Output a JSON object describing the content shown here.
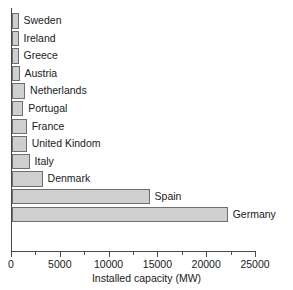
{
  "chart_data": {
    "type": "bar",
    "orientation": "horizontal",
    "title": "",
    "xlabel": "Installed capacity (MW)",
    "ylabel": "",
    "xlim": [
      0,
      25000
    ],
    "xticks": [
      0,
      5000,
      10000,
      15000,
      20000,
      25000
    ],
    "xtick_labels": [
      "0",
      "5000",
      "10000",
      "15000",
      "20000",
      "25000"
    ],
    "minor_ticks": [
      2500,
      7500,
      12500,
      17500,
      22500
    ],
    "grid": false,
    "legend": false,
    "bar_fill_color": "#cfcfcf",
    "bar_border_color": "#6e6e6e",
    "axis_color": "#4a4a4a",
    "categories": [
      "Sweden",
      "Ireland",
      "Greece",
      "Austria",
      "Netherlands",
      "Portugal",
      "France",
      "United Kindom",
      "Italy",
      "Denmark",
      "Spain",
      "Germany"
    ],
    "values": [
      670,
      670,
      670,
      770,
      1340,
      1150,
      1500,
      1500,
      1800,
      3130,
      14100,
      22100
    ],
    "bars": [
      {
        "label": "Sweden",
        "value": 670
      },
      {
        "label": "Ireland",
        "value": 670
      },
      {
        "label": "Greece",
        "value": 670
      },
      {
        "label": "Austria",
        "value": 770
      },
      {
        "label": "Netherlands",
        "value": 1340
      },
      {
        "label": "Portugal",
        "value": 1150
      },
      {
        "label": "France",
        "value": 1500
      },
      {
        "label": "United Kindom",
        "value": 1500
      },
      {
        "label": "Italy",
        "value": 1800
      },
      {
        "label": "Denmark",
        "value": 3130
      },
      {
        "label": "Spain",
        "value": 14100
      },
      {
        "label": "Germany",
        "value": 22100
      }
    ]
  }
}
